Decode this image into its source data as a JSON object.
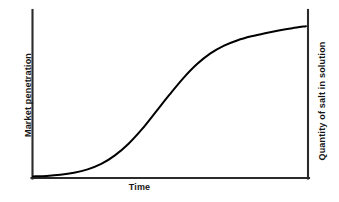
{
  "chart_data": {
    "type": "line",
    "title": "",
    "subtitle": "",
    "xlabel": "Time",
    "ylabel": "Market penetration",
    "ylabel_secondary": "Quantity of salt in solution",
    "curve_name": "S-curve",
    "grid": false,
    "legend": null,
    "axis_ticks": [],
    "tick_labels": [],
    "xlim": [
      0,
      1
    ],
    "ylim": [
      0,
      1
    ],
    "annotations": [],
    "line_color": "#000000",
    "axis_color": "#2b2b2b",
    "background_color": "#ffffff",
    "x": [
      0.0,
      0.05,
      0.1,
      0.15,
      0.2,
      0.25,
      0.3,
      0.35,
      0.4,
      0.45,
      0.5,
      0.55,
      0.6,
      0.65,
      0.7,
      0.75,
      0.8,
      0.85,
      0.9,
      0.95,
      1.0
    ],
    "y": [
      0.005,
      0.008,
      0.015,
      0.028,
      0.05,
      0.085,
      0.14,
      0.215,
      0.31,
      0.42,
      0.53,
      0.635,
      0.725,
      0.795,
      0.845,
      0.88,
      0.905,
      0.925,
      0.942,
      0.957,
      0.97
    ],
    "series": [
      {
        "name": "S-curve",
        "x": [
          0.0,
          0.05,
          0.1,
          0.15,
          0.2,
          0.25,
          0.3,
          0.35,
          0.4,
          0.45,
          0.5,
          0.55,
          0.6,
          0.65,
          0.7,
          0.75,
          0.8,
          0.85,
          0.9,
          0.95,
          1.0
        ],
        "y": [
          0.005,
          0.008,
          0.015,
          0.028,
          0.05,
          0.085,
          0.14,
          0.215,
          0.31,
          0.42,
          0.53,
          0.635,
          0.725,
          0.795,
          0.845,
          0.88,
          0.905,
          0.925,
          0.942,
          0.957,
          0.97
        ]
      }
    ]
  },
  "labels": {
    "x_axis": "Time",
    "y_axis_left": "Market penetration",
    "y_axis_right": "Quantity of salt in solution"
  }
}
